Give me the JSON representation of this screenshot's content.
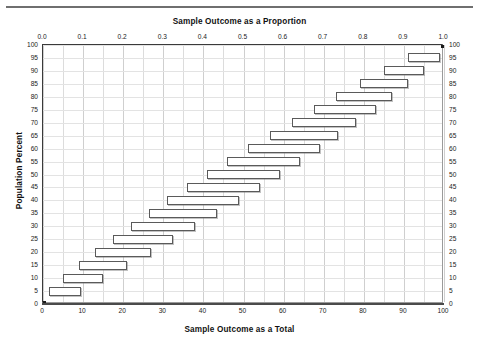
{
  "chart_data": {
    "type": "bar",
    "orientation": "horizontal",
    "title": "",
    "xlabel": "Sample Outcome as a Total",
    "xlabel_top": "Sample Outcome as a Proportion",
    "ylabel": "Population Percent",
    "xlim": [
      0,
      100
    ],
    "ylim": [
      0,
      100
    ],
    "grid": true,
    "legend": null,
    "top_axis_ticks": [
      "0.0",
      "0.1",
      "0.2",
      "0.3",
      "0.4",
      "0.5",
      "0.6",
      "0.7",
      "0.8",
      "0.9",
      "1.0"
    ],
    "top_axis_values": [
      0,
      10,
      20,
      30,
      40,
      50,
      60,
      70,
      80,
      90,
      100
    ],
    "bottom_axis_ticks": [
      "0",
      "10",
      "20",
      "30",
      "40",
      "50",
      "60",
      "70",
      "80",
      "90",
      "100"
    ],
    "bottom_axis_values": [
      0,
      10,
      20,
      30,
      40,
      50,
      60,
      70,
      80,
      90,
      100
    ],
    "y_axis_ticks": [
      "100",
      "95",
      "90",
      "85",
      "80",
      "75",
      "70",
      "65",
      "60",
      "55",
      "50",
      "45",
      "40",
      "35",
      "30",
      "25",
      "20",
      "15",
      "10",
      "5",
      "0"
    ],
    "y_axis_values": [
      100,
      95,
      90,
      85,
      80,
      75,
      70,
      65,
      60,
      55,
      50,
      45,
      40,
      35,
      30,
      25,
      20,
      15,
      10,
      5,
      0
    ],
    "categories": [
      5,
      10,
      15,
      20,
      25,
      30,
      35,
      40,
      45,
      50,
      55,
      60,
      65,
      70,
      75,
      80,
      85,
      90,
      95
    ],
    "bars": [
      {
        "population_percent": 5,
        "low": 1.5,
        "high": 9.5
      },
      {
        "population_percent": 10,
        "low": 5.0,
        "high": 15.0
      },
      {
        "population_percent": 15,
        "low": 9.0,
        "high": 21.0
      },
      {
        "population_percent": 20,
        "low": 13.0,
        "high": 27.0
      },
      {
        "population_percent": 25,
        "low": 17.5,
        "high": 32.5
      },
      {
        "population_percent": 30,
        "low": 22.0,
        "high": 38.0
      },
      {
        "population_percent": 35,
        "low": 26.5,
        "high": 43.5
      },
      {
        "population_percent": 40,
        "low": 31.0,
        "high": 49.0
      },
      {
        "population_percent": 45,
        "low": 36.0,
        "high": 54.0
      },
      {
        "population_percent": 50,
        "low": 41.0,
        "high": 59.0
      },
      {
        "population_percent": 55,
        "low": 46.0,
        "high": 64.0
      },
      {
        "population_percent": 60,
        "low": 51.0,
        "high": 69.0
      },
      {
        "population_percent": 65,
        "low": 56.5,
        "high": 73.5
      },
      {
        "population_percent": 70,
        "low": 62.0,
        "high": 78.0
      },
      {
        "population_percent": 75,
        "low": 67.5,
        "high": 83.0
      },
      {
        "population_percent": 80,
        "low": 73.0,
        "high": 87.0
      },
      {
        "population_percent": 85,
        "low": 79.0,
        "high": 91.0
      },
      {
        "population_percent": 90,
        "low": 85.0,
        "high": 95.0
      },
      {
        "population_percent": 95,
        "low": 91.0,
        "high": 99.0
      }
    ],
    "series": [
      {
        "name": "Lower bound",
        "values": [
          1.5,
          5,
          9,
          13,
          17.5,
          22,
          26.5,
          31,
          36,
          41,
          46,
          51,
          56.5,
          62,
          67.5,
          73,
          79,
          85,
          91
        ]
      },
      {
        "name": "Upper bound",
        "values": [
          9.5,
          15,
          21,
          27,
          32.5,
          38,
          43.5,
          49,
          54,
          59,
          64,
          69,
          73.5,
          78,
          83,
          87,
          91,
          95,
          99
        ]
      }
    ]
  }
}
